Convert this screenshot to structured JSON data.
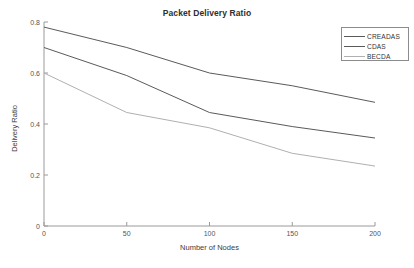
{
  "chart_data": {
    "type": "line",
    "title": "Packet Delivery Ratio",
    "xlabel": "Number of Nodes",
    "ylabel": "Delivery Ratio",
    "x": [
      0,
      50,
      100,
      150,
      200
    ],
    "xlim": [
      0,
      200
    ],
    "ylim": [
      0,
      0.8
    ],
    "xticks": [
      "0",
      "50",
      "100",
      "150",
      "200"
    ],
    "yticks": [
      "0",
      "0.2",
      "0.4",
      "0.6",
      "0.8"
    ],
    "grid": false,
    "legend_position": "top-right",
    "series": [
      {
        "name": "CREADAS",
        "color": "#5a5a5a",
        "values": [
          0.78,
          0.7,
          0.6,
          0.55,
          0.485
        ]
      },
      {
        "name": "CDAS",
        "color": "#5a5a5a",
        "values": [
          0.7,
          0.59,
          0.445,
          0.39,
          0.345
        ]
      },
      {
        "name": "BECDA",
        "color": "#b0b0b0",
        "values": [
          0.6,
          0.445,
          0.385,
          0.285,
          0.235
        ]
      }
    ]
  },
  "axis": {
    "color": "#9a9a9a"
  }
}
